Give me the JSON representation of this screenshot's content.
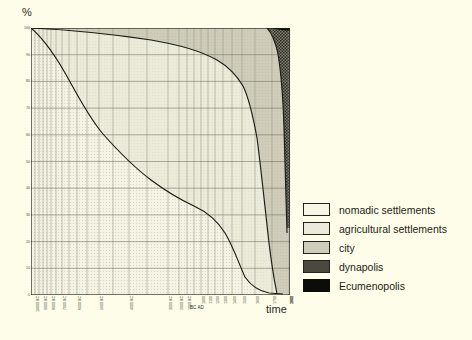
{
  "axes": {
    "y_title": "%",
    "x_title": "time",
    "era_marker": "BC AD"
  },
  "legend": {
    "items": [
      {
        "label": "nomadic settlements",
        "swatch": "sw-nomadic",
        "color": "#f6f5e6"
      },
      {
        "label": "agricultural settlements",
        "swatch": "sw-agri",
        "color": "#eceada"
      },
      {
        "label": "city",
        "swatch": "sw-city",
        "color": "#cfcdba"
      },
      {
        "label": "dynapolis",
        "swatch": "sw-dyna",
        "color": "#4a4940"
      },
      {
        "label": "Ecumenopolis",
        "swatch": "sw-ecu",
        "color": "#0c0c09"
      }
    ]
  },
  "chart_data": {
    "type": "area",
    "title": "",
    "xlabel": "time",
    "ylabel": "%",
    "ylim": [
      0,
      100
    ],
    "grid": true,
    "legend_position": "right",
    "y_ticks": [
      100,
      90,
      80,
      70,
      60,
      50,
      40,
      30,
      20,
      10,
      0
    ],
    "x_tick_labels": [
      "10000 BC",
      "9000 BC",
      "8000 BC",
      "7000 BC",
      "6000 BC",
      "5000 BC",
      "4000 BC",
      "3000 BC",
      "2000 BC",
      "1000 BC",
      "BC AD",
      "1000",
      "1100",
      "1200",
      "1300",
      "1400",
      "1500",
      "1600",
      "1700",
      "1800",
      "1900",
      "2000"
    ],
    "x": [
      "10000 BC",
      "8000 BC",
      "6000 BC",
      "4000 BC",
      "2000 BC",
      "1000 BC",
      "BC AD",
      "1000",
      "1500",
      "1700",
      "1800",
      "1900",
      "1950",
      "2000"
    ],
    "series": [
      {
        "name": "nomadic settlements",
        "values": [
          100,
          88,
          78,
          70,
          62,
          55,
          50,
          43,
          38,
          31,
          24,
          12,
          5,
          1
        ]
      },
      {
        "name": "agricultural settlements",
        "values": [
          0,
          11,
          20,
          27,
          34,
          40,
          44,
          50,
          54,
          58,
          62,
          65,
          50,
          26
        ]
      },
      {
        "name": "city",
        "values": [
          0,
          1,
          2,
          3,
          4,
          5,
          6,
          7,
          8,
          11,
          14,
          22,
          30,
          18
        ]
      },
      {
        "name": "dynapolis",
        "values": [
          0,
          0,
          0,
          0,
          0,
          0,
          0,
          0,
          0,
          0,
          0,
          1,
          15,
          53
        ]
      },
      {
        "name": "Ecumenopolis",
        "values": [
          0,
          0,
          0,
          0,
          0,
          0,
          0,
          0,
          0,
          0,
          0,
          0,
          0,
          2
        ]
      }
    ],
    "annotations": [
      "Stacked percentage of world settlement types over logarithmic time",
      "Nomadic share declines from 100% to near zero by 2000",
      "Dynapolis emerges after 1900 and dominates by 2000",
      "Ecumenopolis appears as a thin band at the top right"
    ]
  }
}
